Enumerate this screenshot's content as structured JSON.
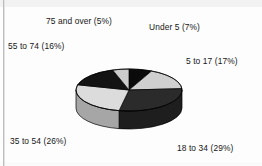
{
  "figure": {
    "background_color": "#fdfdfd",
    "text_color": "#161616"
  },
  "chart_data": {
    "type": "pie",
    "title": "",
    "subtitle": "",
    "xlabel": "",
    "ylabel": "",
    "legend_position": "none",
    "grid": false,
    "three_d": true,
    "start_angle_deg": 0,
    "direction": "clockwise",
    "categories": [
      "Under 5",
      "5 to 17",
      "18 to 34",
      "35 to 54",
      "55 to 74",
      "75 and over"
    ],
    "values": [
      7,
      17,
      29,
      26,
      16,
      5
    ],
    "value_unit": "%",
    "labels": [
      "Under 5  (7%)",
      "5 to 17 (17%)",
      "18 to 34 (29%)",
      "35 to 54 (26%)",
      "55 to 74 (16%)",
      "75 and over (5%)"
    ],
    "slice_colors": [
      "#0b0b0b",
      "#cfcfcf",
      "#2b2b2b",
      "#dcdcdc",
      "#131313",
      "#cccccc"
    ],
    "slice_side_colors": [
      "#050505",
      "#9a9a9a",
      "#1e1e1e",
      "#a6a6a6",
      "#0a0a0a",
      "#969696"
    ],
    "slice_edge_color": "#000000"
  },
  "labels": {
    "under_5": "Under 5  (7%)",
    "age_5_to_17": "5 to 17 (17%)",
    "age_18_to_34": "18 to 34 (29%)",
    "age_35_to_54": "35 to 54 (26%)",
    "age_55_to_74": "55 to 74 (16%)",
    "age_75_and_over": "75 and over (5%)"
  }
}
